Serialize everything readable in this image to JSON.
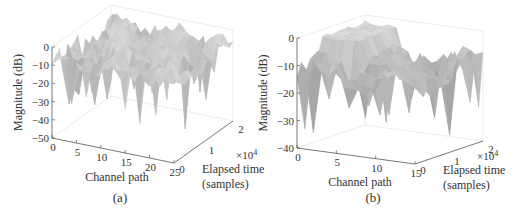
{
  "chart_data": [
    {
      "type": "surface3d",
      "panel_label": "(a)",
      "xlabel": "Channel path",
      "ylabel": "Elapsed time (samples)",
      "ylabel_line1": "Elapsed time",
      "ylabel_line2": "(samples)",
      "y_multiplier": "×10",
      "y_multiplier_exp": "4",
      "zlabel": "Magnitude (dB)",
      "xlim": [
        0,
        25
      ],
      "ylim": [
        0,
        2
      ],
      "zlim": [
        -50,
        0
      ],
      "x_ticks": [
        "0",
        "5",
        "10",
        "15",
        "20",
        "25"
      ],
      "y_ticks": [
        "0",
        "1",
        "2"
      ],
      "z_ticks": [
        "0",
        "-10",
        "-20",
        "-30",
        "-40",
        "-50"
      ],
      "x_tick_values": [
        0,
        5,
        10,
        15,
        20,
        25
      ],
      "y_tick_values": [
        0,
        1,
        2
      ],
      "z_tick_values": [
        0,
        -10,
        -20,
        -30,
        -40,
        -50
      ],
      "surface_typical_level_db": -8,
      "deep_fades_db": [
        {
          "x": 2,
          "y": 0.2,
          "z": -33
        },
        {
          "x": 4,
          "y": 0.3,
          "z": -27
        },
        {
          "x": 7,
          "y": 0.4,
          "z": -22
        },
        {
          "x": 9,
          "y": 0.5,
          "z": -20
        },
        {
          "x": 13,
          "y": 0.6,
          "z": -23
        },
        {
          "x": 16,
          "y": 0.7,
          "z": -25
        },
        {
          "x": 19,
          "y": 0.8,
          "z": -27
        },
        {
          "x": 22,
          "y": 0.9,
          "z": -43
        },
        {
          "x": 24,
          "y": 1.2,
          "z": -30
        }
      ]
    },
    {
      "type": "surface3d",
      "panel_label": "(b)",
      "xlabel": "Channel path",
      "ylabel": "Elapsed time (samples)",
      "ylabel_line1": "Elapsed time",
      "ylabel_line2": "(samples)",
      "y_multiplier": "×10",
      "y_multiplier_exp": "4",
      "zlabel": "Magnitude (dB)",
      "xlim": [
        0,
        15
      ],
      "ylim": [
        0,
        2
      ],
      "zlim": [
        -40,
        0
      ],
      "x_ticks": [
        "0",
        "5",
        "10",
        "15"
      ],
      "y_ticks": [
        "0",
        "1",
        "2"
      ],
      "z_ticks": [
        "0",
        "-10",
        "-20",
        "-30",
        "-40"
      ],
      "x_tick_values": [
        0,
        5,
        10,
        15
      ],
      "y_tick_values": [
        0,
        1,
        2
      ],
      "z_tick_values": [
        0,
        -10,
        -20,
        -30,
        -40
      ],
      "surface_typical_level_db": -12,
      "deep_fades_db": [
        {
          "x": 1,
          "y": 0.2,
          "z": -35
        },
        {
          "x": 3,
          "y": 0.3,
          "z": -22
        },
        {
          "x": 5,
          "y": 0.4,
          "z": -25
        },
        {
          "x": 7,
          "y": 0.5,
          "z": -24
        },
        {
          "x": 9,
          "y": 0.6,
          "z": -27
        },
        {
          "x": 11,
          "y": 0.8,
          "z": -26
        },
        {
          "x": 14,
          "y": 1.2,
          "z": -35
        }
      ]
    }
  ]
}
